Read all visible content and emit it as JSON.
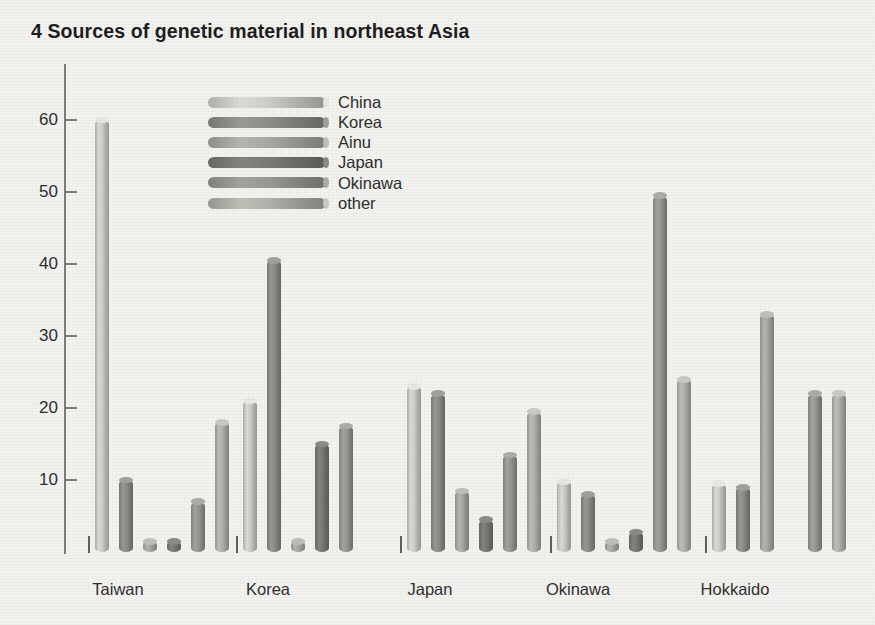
{
  "title": "4 Sources of genetic material in northeast Asia",
  "legend": {
    "position": "top-left-inside",
    "entries": [
      {
        "label": "China",
        "color": "#c9c9c4"
      },
      {
        "label": "Korea",
        "color": "#8a8a85"
      },
      {
        "label": "Ainu",
        "color": "#a5a5a0"
      },
      {
        "label": "Japan",
        "color": "#777772"
      },
      {
        "label": "Okinawa",
        "color": "#949490"
      },
      {
        "label": "other",
        "color": "#aeaea9"
      }
    ]
  },
  "axis": {
    "y_ticks": [
      10,
      20,
      30,
      40,
      50,
      60
    ],
    "y_min": 0,
    "y_max": 65,
    "x_labels": [
      "Taiwan",
      "Korea",
      "Japan",
      "Okinawa",
      "Hokkaido"
    ]
  },
  "chart_data": {
    "type": "bar",
    "title": "4 Sources of genetic material in northeast Asia",
    "xlabel": "",
    "ylabel": "",
    "ylim": [
      0,
      65
    ],
    "grid": false,
    "legend_position": "top-left-inside",
    "categories": [
      "Taiwan",
      "Korea",
      "Japan",
      "Okinawa",
      "Hokkaido"
    ],
    "series": [
      {
        "name": "China",
        "color": "#c9c9c4",
        "values": [
          60,
          21,
          23,
          9.8,
          9.5
        ]
      },
      {
        "name": "Korea",
        "color": "#8a8a85",
        "values": [
          10,
          40.5,
          22,
          8,
          9
        ]
      },
      {
        "name": "Ainu",
        "color": "#a5a5a0",
        "values": [
          1.5,
          1.5,
          8.5,
          1.5,
          33
        ]
      },
      {
        "name": "Japan",
        "color": "#777772",
        "values": [
          1.5,
          15,
          4.5,
          2.8,
          0
        ]
      },
      {
        "name": "Okinawa",
        "color": "#949490",
        "values": [
          7,
          17.5,
          13.5,
          49.5,
          22
        ]
      },
      {
        "name": "other",
        "color": "#aeaea9",
        "values": [
          18,
          0,
          19.5,
          24,
          22
        ]
      }
    ]
  },
  "layout": {
    "group_left_x": [
      95,
      243,
      407,
      557,
      712
    ],
    "bar_width": 14,
    "bar_pitch": 24,
    "baseline_y": 552,
    "value_top_y": 120,
    "value_top": 60,
    "group_tick_x": [
      88,
      236,
      400,
      550,
      705
    ],
    "group_label_x": [
      118,
      268,
      430,
      578,
      735
    ]
  }
}
